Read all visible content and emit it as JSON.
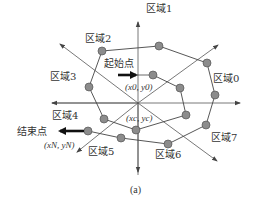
{
  "diagram": {
    "caption": "(a)",
    "regions": [
      {
        "label": "区域0",
        "x": 214,
        "y": 83
      },
      {
        "label": "区域1",
        "x": 146,
        "y": 12
      },
      {
        "label": "区域2",
        "x": 83,
        "y": 13
      },
      {
        "label": "区域3",
        "x": 50,
        "y": 79
      },
      {
        "label": "区域4",
        "x": 50,
        "y": 118
      },
      {
        "label": "区域5",
        "x": 87,
        "y": 155
      },
      {
        "label": "区域6",
        "x": 156,
        "y": 157
      },
      {
        "label": "区域7",
        "x": 210,
        "y": 141
      }
    ],
    "start_label": "起始点",
    "start_coord": "(x0, y0)",
    "center_coord": "(xc, yc)",
    "end_label": "结束点",
    "end_coord": "(xN, yN)",
    "colors": {
      "node_fill": "#8c8c8c",
      "node_stroke": "#555555",
      "line": "#444444"
    }
  }
}
